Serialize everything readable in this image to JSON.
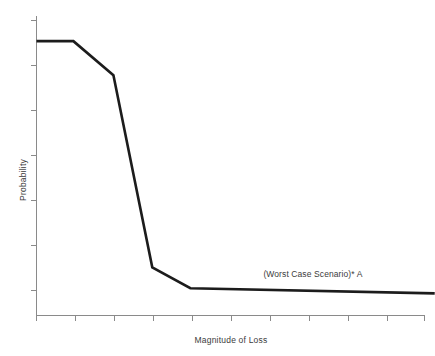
{
  "chart_data": {
    "type": "line",
    "title": "",
    "subtitle": "",
    "xlabel": "Magnitude of Loss",
    "ylabel": "Probability",
    "grid": false,
    "legend": "none",
    "axis_tick_labels": {
      "x": [],
      "y": []
    },
    "x_tick_count": 11,
    "y_tick_count": 7,
    "xlim": [
      0,
      10
    ],
    "ylim": [
      0,
      10
    ],
    "series": [
      {
        "name": "Risk curve A",
        "x": [
          0.0,
          0.95,
          1.98,
          2.98,
          3.96,
          10.25
        ],
        "y": [
          9.16,
          9.16,
          8.02,
          1.61,
          0.91,
          0.74
        ],
        "color": "#1c1c1c"
      }
    ],
    "annotations": [
      {
        "name": "worst-case-scenario-label",
        "text": "(Worst Case Scenario)* A",
        "x": 5.84,
        "y": 1.27
      }
    ]
  },
  "figure": {
    "background_color": "#ffffff",
    "axis_color": "#8a8a8a",
    "text_color": "#3b3b3b",
    "line_color": "#1c1c1c"
  }
}
